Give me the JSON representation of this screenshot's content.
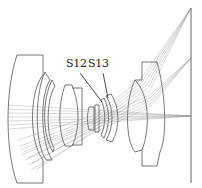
{
  "diagram": {
    "type": "optical-lens-layout",
    "labels": [
      {
        "id": "S12",
        "text": "S12"
      },
      {
        "id": "S13",
        "text": "S13"
      }
    ],
    "colors": {
      "lens_outline": "#555555",
      "ray": "#777777",
      "label": "#222222",
      "background": "#ffffff"
    },
    "elements": [
      "front-meniscus-lens",
      "second-meniscus-lens",
      "third-meniscus-lens",
      "biconvex-lens",
      "cemented-doublet-small",
      "aperture-group-s12-s13",
      "rear-meniscus-lens",
      "image-plane"
    ],
    "ray_fields": [
      "on-axis",
      "mid-field",
      "full-field"
    ]
  }
}
